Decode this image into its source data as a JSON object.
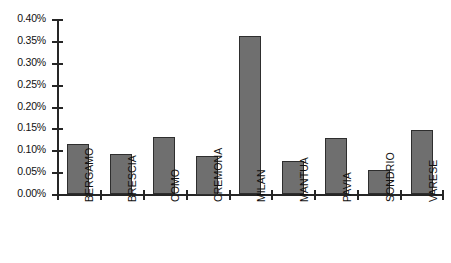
{
  "chart_data": {
    "type": "bar",
    "title": "",
    "subtitle": "",
    "xlabel": "",
    "ylabel": "",
    "categories": [
      "BERGAMO",
      "BRESCIA",
      "COMO",
      "CREMONA",
      "MILAN",
      "MANTUA",
      "PAVIA",
      "SONDRIO",
      "VARESE"
    ],
    "values": [
      0.115,
      0.092,
      0.13,
      0.088,
      0.362,
      0.075,
      0.128,
      0.054,
      0.147
    ],
    "value_unit": "%",
    "ylim": [
      0.0,
      0.4
    ],
    "ytick_values": [
      0.0,
      0.05,
      0.1,
      0.15,
      0.2,
      0.25,
      0.3,
      0.35,
      0.4
    ],
    "ytick_labels": [
      "0.00%",
      "0.05%",
      "0.10%",
      "0.15%",
      "0.20%",
      "0.25%",
      "0.30%",
      "0.35%",
      "0.40%"
    ],
    "grid": false,
    "legend": false,
    "legend_position": "none",
    "bar_fill_color": "#6f6f6f",
    "bar_edge_color": "#2e2e2e",
    "axis_color": "#262626",
    "background_color": "#ffffff",
    "xtick_label_rotation": 90
  }
}
